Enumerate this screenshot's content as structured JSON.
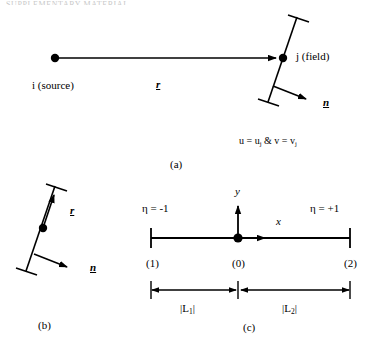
{
  "figure": {
    "header_fragment": "SUPPLEMENTARY MATERIAL",
    "panels": [
      {
        "id": "a",
        "caption": "(a)"
      },
      {
        "id": "b",
        "caption": "(b)"
      },
      {
        "id": "c",
        "caption": "(c)"
      }
    ]
  },
  "panel_a": {
    "source_label": "i (source)",
    "field_label": "j (field)",
    "r_label": "r",
    "normal_label": "n",
    "velocity_label_u": "u = u",
    "velocity_label_sub1": "j",
    "velocity_label_mid": " & v = v",
    "velocity_label_sub2": "j",
    "velocity_full": "u = uj & v = vj",
    "caption": "(a)"
  },
  "panel_b": {
    "r_label": "r",
    "normal_label": "n",
    "caption": "(b)"
  },
  "panel_c": {
    "eta_left": "η = -1",
    "eta_right": "η = +1",
    "y_axis_label": "y",
    "x_axis_label": "x",
    "node_left": "(1)",
    "node_mid": "(0)",
    "node_right": "(2)",
    "length_left_prefix": "|L",
    "length_left_sub": "1",
    "length_left_suffix": "|",
    "length_right_prefix": "|L",
    "length_right_sub": "2",
    "length_right_suffix": "|",
    "length_left_full": "|L1|",
    "length_right_full": "|L2|",
    "caption": "(c)"
  },
  "colors": {
    "ink": "#000000",
    "paper": "#ffffff",
    "faint": "#c9c9c9"
  }
}
